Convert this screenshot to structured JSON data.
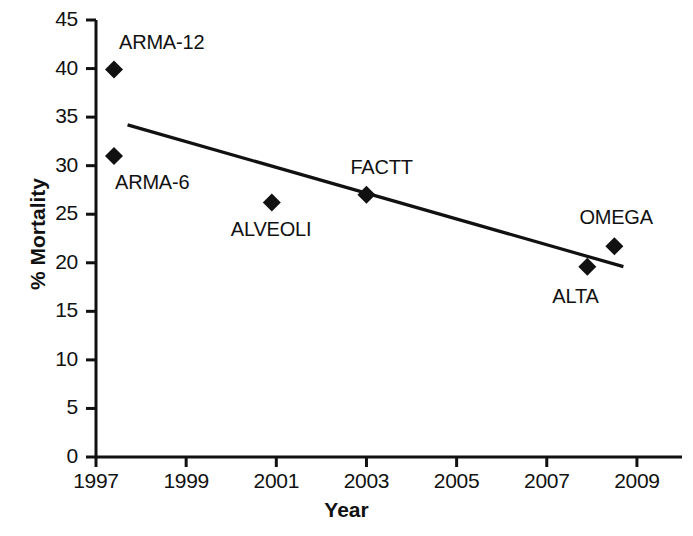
{
  "chart_data": {
    "type": "scatter",
    "title": "",
    "xlabel": "Year",
    "ylabel": "% Mortality",
    "xlim": [
      1997,
      2010
    ],
    "ylim": [
      0,
      45
    ],
    "xticks": [
      1997,
      1999,
      2001,
      2003,
      2005,
      2007,
      2009
    ],
    "yticks": [
      0,
      5,
      10,
      15,
      20,
      25,
      30,
      35,
      40,
      45
    ],
    "grid": false,
    "legend": "none",
    "marker": "diamond",
    "marker_color": "#111111",
    "line_color": "#111111",
    "points": [
      {
        "label": "ARMA-12",
        "x": 1997.4,
        "y": 39.9,
        "label_pos": "above"
      },
      {
        "label": "ARMA-6",
        "x": 1997.4,
        "y": 31.0,
        "label_pos": "below"
      },
      {
        "label": "ALVEOLI",
        "x": 2000.9,
        "y": 26.2,
        "label_pos": "below"
      },
      {
        "label": "FACTT",
        "x": 2003.0,
        "y": 27.0,
        "label_pos": "above"
      },
      {
        "label": "ALTA",
        "x": 2007.9,
        "y": 19.6,
        "label_pos": "below"
      },
      {
        "label": "OMEGA",
        "x": 2008.5,
        "y": 21.7,
        "label_pos": "above"
      }
    ],
    "trendline": {
      "name": "linear fit",
      "x": [
        1997.7,
        2008.7
      ],
      "y": [
        34.2,
        19.6
      ]
    }
  },
  "axes": {
    "x_tick_labels": [
      "1997",
      "1999",
      "2001",
      "2003",
      "2005",
      "2007",
      "2009"
    ],
    "y_tick_labels": [
      "0",
      "5",
      "10",
      "15",
      "20",
      "25",
      "30",
      "35",
      "40",
      "45"
    ],
    "x_title": "Year",
    "y_title": "% Mortality"
  },
  "point_labels": [
    "ARMA-12",
    "ARMA-6",
    "ALVEOLI",
    "FACTT",
    "ALTA",
    "OMEGA"
  ]
}
